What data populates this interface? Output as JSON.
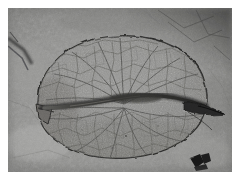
{
  "image": {
    "domain": "Natural-Image",
    "subject": "fossil-leaf-impression",
    "description": "Black-and-white photograph of a fossilized leaf impression preserved on a fine-grained rock slab",
    "palette": {
      "page_background": "#ffffff",
      "matrix_light": "#a9a9a7",
      "matrix_mid": "#8d8d8b",
      "matrix_dark": "#6a6a68",
      "rock_corner_dark": "#4a4a49",
      "leaf_blade": "#8a8a88",
      "vein_line": "#4d4d4b",
      "midrib_dark": "#3a3a38",
      "outline_dark": "#2e2e2d",
      "fragment_black": "#191919"
    },
    "framing": {
      "photo_left": 8,
      "photo_top": 8,
      "photo_width": 224,
      "photo_height": 164,
      "border_color": "#ffffff"
    },
    "features": [
      {
        "name": "rock-matrix",
        "note": "mottled gray sediment surface filling the whole frame"
      },
      {
        "name": "leaf-blade",
        "note": "broad orbicular to elliptic leaf outline spanning most of the frame"
      },
      {
        "name": "midrib",
        "note": "dark horizontal central vein crossing the blade, thickening toward the right"
      },
      {
        "name": "reticulate-venation",
        "note": "dense polygonal network of secondary and tertiary veins across both halves"
      },
      {
        "name": "leaf-apex",
        "note": "dark pointed tip projecting to the right edge of the blade"
      },
      {
        "name": "leaf-base-notch",
        "note": "angular notch and fold at the left margin of the blade"
      },
      {
        "name": "corner-shadow",
        "note": "darker rock tone occupying the upper-right corner"
      },
      {
        "name": "diagonal-crack",
        "note": "dark diagonal fracture line in the upper-left matrix"
      },
      {
        "name": "dark-fragment",
        "note": "small black angular mineral fragment on the matrix at lower right"
      }
    ]
  }
}
